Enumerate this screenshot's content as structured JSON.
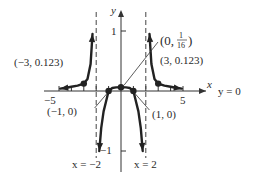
{
  "chart_data": {
    "type": "line",
    "title": "",
    "function": "f(x) = 1/(x^2 - 4)^2-like rational graph with vertical asymptotes x = -2, x = 2 and horizontal asymptote y = 0",
    "xlabel": "x",
    "ylabel": "y",
    "xlim": [
      -6,
      6.5
    ],
    "ylim": [
      -1.1,
      1.2
    ],
    "x_ticks": [
      -5,
      -4,
      -3,
      -2,
      -1,
      1,
      2,
      3,
      4,
      5
    ],
    "x_tick_labels": [
      {
        "value": -5,
        "text": "−5"
      },
      {
        "value": 5,
        "text": "5"
      }
    ],
    "y_ticks": [
      1,
      -1
    ],
    "y_tick_labels": [
      {
        "value": 1,
        "text": "1"
      },
      {
        "value": -1,
        "text": "−1"
      }
    ],
    "asymptotes": {
      "vertical": [
        {
          "x": -2,
          "label": "x = −2"
        },
        {
          "x": 2,
          "label": "x = 2"
        }
      ],
      "horizontal": [
        {
          "y": 0,
          "label": "y = 0"
        }
      ]
    },
    "series": [
      {
        "name": "left-branch",
        "x": [
          -4.9,
          -4.5,
          -4,
          -3.5,
          -3,
          -2.7,
          -2.45,
          -2.3
        ],
        "y": [
          0.04,
          0.05,
          0.07,
          0.09,
          0.123,
          0.2,
          0.45,
          0.95
        ]
      },
      {
        "name": "middle-branch",
        "x": [
          -1.75,
          -1.6,
          -1.4,
          -1.2,
          -1,
          -0.7,
          -0.4,
          0,
          0.4,
          0.7,
          1,
          1.2,
          1.4,
          1.6,
          1.75
        ],
        "y": [
          -1.0,
          -0.62,
          -0.34,
          -0.17,
          0,
          0.05,
          0.06,
          0.0625,
          0.06,
          0.05,
          0,
          -0.17,
          -0.34,
          -0.62,
          -1.0
        ]
      },
      {
        "name": "right-branch",
        "x": [
          2.3,
          2.45,
          2.7,
          3,
          3.5,
          4,
          4.5,
          4.9
        ],
        "y": [
          0.95,
          0.45,
          0.2,
          0.123,
          0.09,
          0.07,
          0.05,
          0.04
        ]
      }
    ],
    "points": [
      {
        "x": -3,
        "y": 0.123,
        "label": "(−3, 0.123)"
      },
      {
        "x": 3,
        "y": 0.123,
        "label": "(3, 0.123)"
      },
      {
        "x": -1,
        "y": 0,
        "label": "(−1, 0)"
      },
      {
        "x": 1,
        "y": 0,
        "label": "(1, 0)"
      },
      {
        "x": 0,
        "y": 0.0625,
        "label_prefix": "(0,",
        "label_num": "1",
        "label_den": "16",
        "label_suffix": ")"
      }
    ],
    "grid": false,
    "legend": "none"
  }
}
